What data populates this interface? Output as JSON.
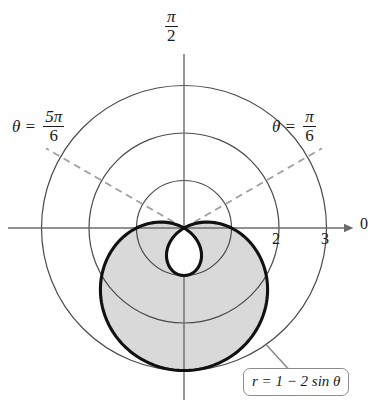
{
  "figure": {
    "background_color": "#ffffff",
    "curve_color": "#111111",
    "grid_color": "#4a4a4a",
    "axis_color": "#6b6b6b",
    "dashed_ray_color": "#9e9e9e",
    "shade_color": "#d9d9d9",
    "callout_border_color": "#8c8c8c"
  },
  "labels": {
    "vertical_axis": {
      "symbol": "",
      "numerator": "π",
      "denominator": "2"
    },
    "polar_axis": "0",
    "angle_left": {
      "lead": "θ =",
      "numerator": "5π",
      "denominator": "6"
    },
    "angle_right": {
      "lead": "θ =",
      "numerator": "π",
      "denominator": "6"
    },
    "tick_2": "2",
    "tick_3": "3",
    "equation": "r = 1 − 2 sin θ"
  },
  "chart_data": {
    "type": "line",
    "coordinate_system": "polar",
    "equation": "r = 1 - 2 sin θ",
    "curve_name": "limacon with inner loop",
    "xlabel": "0",
    "ylabel": "π/2",
    "grid": true,
    "legend_position": "callout-bottom-right",
    "polar_grid_circles": [
      1,
      2,
      3
    ],
    "radial_tick_labels": [
      "2",
      "3"
    ],
    "angle_rays_dashed": [
      {
        "label": "θ = π/6",
        "theta_radians": 0.5235988,
        "theta_degrees": 30
      },
      {
        "label": "θ = 5π/6",
        "theta_radians": 2.6179939,
        "theta_degrees": 150
      }
    ],
    "r_range": [
      -1,
      3
    ],
    "theta_range_degrees": [
      0,
      360
    ],
    "zeros_at_theta_degrees": [
      30,
      150
    ],
    "max_r": 3,
    "max_r_at_theta_degrees": 270,
    "inner_loop_max_r": 1,
    "inner_loop_at_theta_degrees": 90,
    "shaded_region": "interior of outer loop",
    "sampled_points": [
      {
        "theta_degrees": 0,
        "r": 1.0
      },
      {
        "theta_degrees": 30,
        "r": 0.0
      },
      {
        "theta_degrees": 60,
        "r": -0.732
      },
      {
        "theta_degrees": 90,
        "r": -1.0
      },
      {
        "theta_degrees": 120,
        "r": -0.732
      },
      {
        "theta_degrees": 150,
        "r": 0.0
      },
      {
        "theta_degrees": 180,
        "r": 1.0
      },
      {
        "theta_degrees": 210,
        "r": 2.0
      },
      {
        "theta_degrees": 240,
        "r": 2.732
      },
      {
        "theta_degrees": 270,
        "r": 3.0
      },
      {
        "theta_degrees": 300,
        "r": 2.732
      },
      {
        "theta_degrees": 330,
        "r": 2.0
      },
      {
        "theta_degrees": 360,
        "r": 1.0
      }
    ]
  },
  "geometry": {
    "pole_x": 184,
    "pole_y": 228,
    "unit_px": 47.5
  }
}
